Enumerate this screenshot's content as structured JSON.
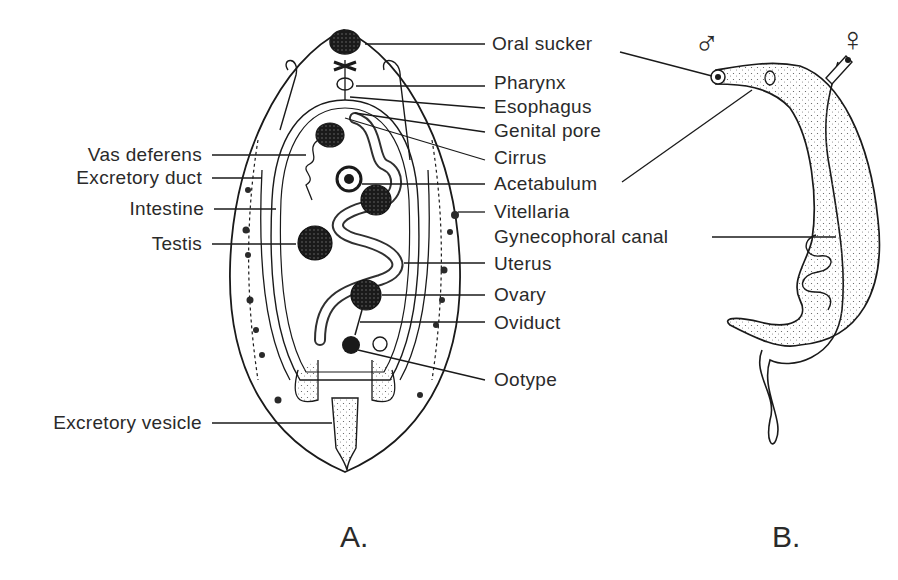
{
  "figure": {
    "panels": [
      {
        "id": "A",
        "label": "A.",
        "subject": "fluke-anatomy"
      },
      {
        "id": "B",
        "label": "B.",
        "subject": "schistosome-pair"
      }
    ],
    "left_labels": [
      {
        "text": "Vas deferens",
        "y": 155
      },
      {
        "text": "Excretory duct",
        "y": 178
      },
      {
        "text": "Intestine",
        "y": 209
      },
      {
        "text": "Testis",
        "y": 244
      },
      {
        "text": "Excretory vesicle",
        "y": 423
      }
    ],
    "right_labels": [
      {
        "text": "Oral sucker",
        "y": 44
      },
      {
        "text": "Pharynx",
        "y": 82
      },
      {
        "text": "Esophagus",
        "y": 106
      },
      {
        "text": "Genital pore",
        "y": 130
      },
      {
        "text": "Cirrus",
        "y": 157
      },
      {
        "text": "Acetabulum",
        "y": 184
      },
      {
        "text": "Vitellaria",
        "y": 212
      },
      {
        "text": "Gynecophoral canal",
        "y": 237
      },
      {
        "text": "Uterus",
        "y": 263
      },
      {
        "text": "Ovary",
        "y": 295
      },
      {
        "text": "Oviduct",
        "y": 322
      },
      {
        "text": "Ootype",
        "y": 380
      }
    ],
    "symbols": {
      "male": "♂",
      "female": "♀"
    }
  }
}
